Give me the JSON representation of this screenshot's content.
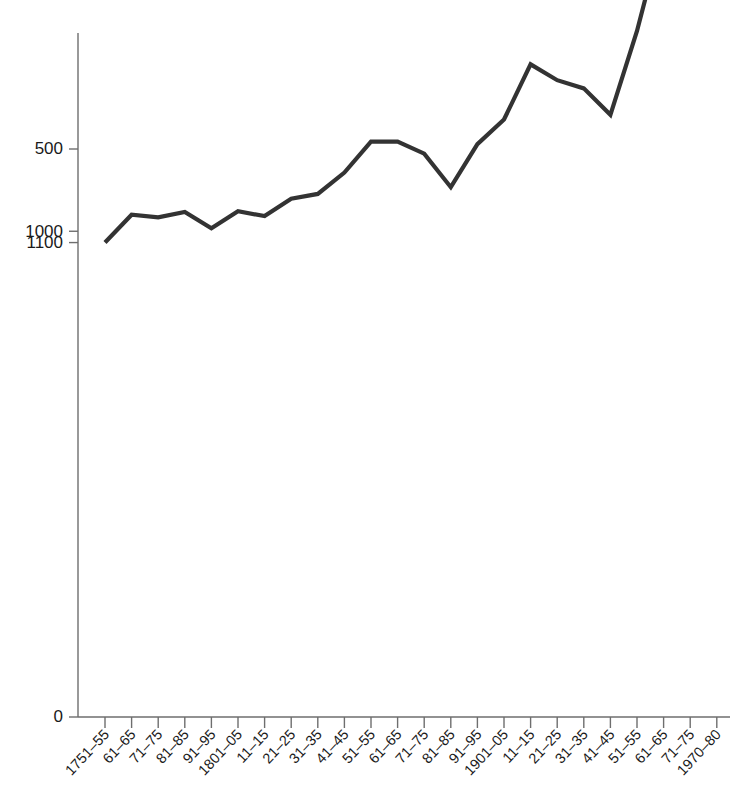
{
  "chart_data": {
    "type": "line",
    "title": "",
    "subtitle": "",
    "xlabel": "",
    "ylabel": "",
    "yscale": "log",
    "grid": false,
    "legend": null,
    "line_color": "#333333",
    "axis_color": "#6e6e6e",
    "ytick_labels": [
      "1100",
      "1000",
      "500",
      "100",
      "50",
      "10",
      "5",
      "0"
    ],
    "ytick_values": [
      1100,
      1000,
      500,
      100,
      50,
      10,
      5,
      0
    ],
    "ylim": [
      5,
      1100
    ],
    "categories": [
      "1751–55",
      "61–65",
      "71–75",
      "81–85",
      "91–95",
      "1801–05",
      "11–15",
      "21–25",
      "31–35",
      "41–45",
      "51–55",
      "61–65",
      "71–75",
      "81–85",
      "91–95",
      "1901–05",
      "11–15",
      "21–25",
      "31–35",
      "41–45",
      "51–55",
      "61–65",
      "71–75",
      "1970–80"
    ],
    "values": [
      1100,
      870,
      890,
      850,
      975,
      845,
      880,
      760,
      730,
      610,
      470,
      470,
      520,
      690,
      480,
      390,
      245,
      280,
      300,
      375,
      185,
      78,
      60,
      7
    ]
  }
}
